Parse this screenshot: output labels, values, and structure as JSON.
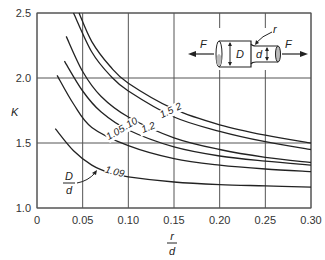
{
  "chart_data": {
    "type": "line",
    "title": "",
    "xlabel": "r/d",
    "ylabel": "K",
    "xlim": [
      0,
      0.3
    ],
    "ylim": [
      1.0,
      2.5
    ],
    "grid": true,
    "xticks": [
      "0",
      "0.05",
      "0.10",
      "0.15",
      "0.20",
      "0.25",
      "0.30"
    ],
    "yticks": [
      "1.0",
      "1.5",
      "2.0",
      "2.5"
    ],
    "legend_title": "D/d",
    "series": [
      {
        "name": "2",
        "x": [
          0.046,
          0.06,
          0.08,
          0.1,
          0.15,
          0.2,
          0.25,
          0.3
        ],
        "y": [
          2.5,
          2.28,
          2.09,
          1.96,
          1.76,
          1.64,
          1.56,
          1.5
        ]
      },
      {
        "name": "1.5",
        "x": [
          0.04,
          0.06,
          0.08,
          0.1,
          0.15,
          0.2,
          0.25,
          0.3
        ],
        "y": [
          2.5,
          2.2,
          2.02,
          1.9,
          1.7,
          1.59,
          1.51,
          1.45
        ]
      },
      {
        "name": "1.2",
        "x": [
          0.032,
          0.05,
          0.07,
          0.1,
          0.15,
          0.2,
          0.25,
          0.3
        ],
        "y": [
          2.32,
          2.05,
          1.86,
          1.7,
          1.54,
          1.45,
          1.39,
          1.35
        ]
      },
      {
        "name": "1.10",
        "x": [
          0.03,
          0.05,
          0.07,
          0.1,
          0.15,
          0.2,
          0.25,
          0.3
        ],
        "y": [
          2.13,
          1.9,
          1.74,
          1.6,
          1.47,
          1.4,
          1.36,
          1.33
        ]
      },
      {
        "name": "1.05",
        "x": [
          0.022,
          0.04,
          0.06,
          0.1,
          0.15,
          0.2,
          0.25,
          0.3
        ],
        "y": [
          2.02,
          1.8,
          1.62,
          1.48,
          1.38,
          1.33,
          1.3,
          1.28
        ]
      },
      {
        "name": "1.09",
        "x": [
          0.02,
          0.04,
          0.06,
          0.08,
          0.1,
          0.15,
          0.2,
          0.25,
          0.3
        ],
        "y": [
          1.61,
          1.44,
          1.33,
          1.27,
          1.24,
          1.2,
          1.18,
          1.17,
          1.16
        ]
      }
    ],
    "annotations": [
      "D/d",
      "F",
      "D",
      "d",
      "r"
    ]
  },
  "labels": {
    "y_axis": "K",
    "x_axis_num": "r",
    "x_axis_den": "d",
    "legend_num": "D",
    "legend_den": "d",
    "force_left": "F",
    "force_right": "F",
    "big_dia": "D",
    "small_dia": "d",
    "radius": "r"
  }
}
